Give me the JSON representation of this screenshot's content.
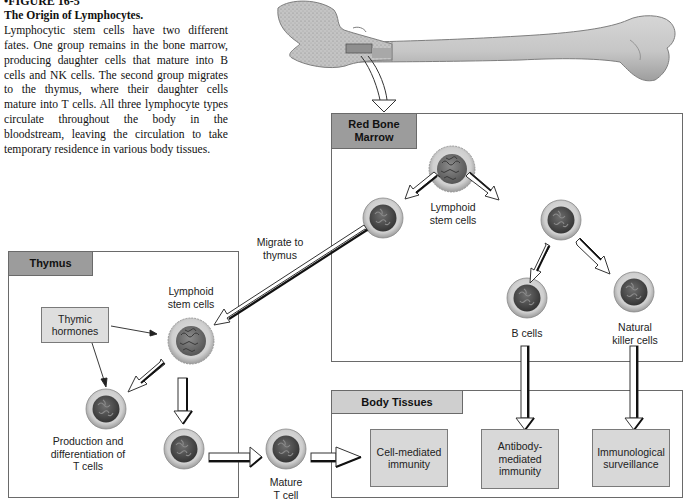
{
  "caption": {
    "figure_number": "•FIGURE 16-5",
    "title": "The Origin of Lymphocytes.",
    "body": "Lymphocytic stem cells have two different fates. One group remains in the bone marrow, producing daughter cells that mature into B cells and NK cells. The second group migrates to the thymus, where their daughter cells mature into T cells. All three lymphocyte types circulate throughout the body in the bloodstream, leaving the circulation to take temporary residence in various body tissues."
  },
  "panels": {
    "red_bone_marrow": {
      "title_line1": "Red Bone",
      "title_line2": "Marrow",
      "stem_label_line1": "Lymphoid",
      "stem_label_line2": "stem cells",
      "b_cells_label": "B cells",
      "nk_label_line1": "Natural",
      "nk_label_line2": "killer cells"
    },
    "thymus": {
      "title": "Thymus",
      "hormones_line1": "Thymic",
      "hormones_line2": "hormones",
      "stem_label_line1": "Lymphoid",
      "stem_label_line2": "stem cells",
      "production_line1": "Production and",
      "production_line2": "differentiation of",
      "production_line3": "T cells"
    },
    "body_tissues": {
      "title": "Body Tissues",
      "outcomes": [
        {
          "line1": "Cell-mediated",
          "line2": "immunity",
          "line3": ""
        },
        {
          "line1": "Antibody-",
          "line2": "mediated",
          "line3": "immunity"
        },
        {
          "line1": "Immunological",
          "line2": "surveillance",
          "line3": ""
        }
      ]
    }
  },
  "labels": {
    "migrate_line1": "Migrate to",
    "migrate_line2": "thymus",
    "mature_line1": "Mature",
    "mature_line2": "T cell"
  },
  "colors": {
    "panel_tab_dark": "#9c9c9c",
    "panel_tab_light": "#cfcfcf",
    "outcome_fill": "#d8d8d8",
    "cell_cytoplasm": "#c9c9c9",
    "cell_nucleus": "#4a4a4a",
    "bone": "#bdbdbd"
  }
}
